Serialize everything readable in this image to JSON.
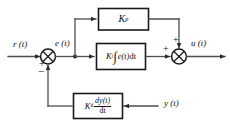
{
  "diagram": {
    "type": "control-system-block-diagram",
    "background_color": "#ffffff",
    "line_color": "#4d4d4d",
    "block_border_color": "#1a1a1a",
    "signals": {
      "reference": "r (t)",
      "error": "e (t)",
      "control_output": "u (t)",
      "feedback_measurement": "y (t)"
    },
    "blocks": [
      {
        "id": "proportional",
        "gain_symbol": "K",
        "gain_subscript": "p",
        "expression": "K_p",
        "role": "proportional-gain"
      },
      {
        "id": "integral",
        "gain_symbol": "K",
        "gain_subscript": "i",
        "integrand": "e(t)",
        "differential": "dt",
        "expression": "K_i ∫ e(t)dt",
        "role": "integral-term"
      },
      {
        "id": "derivative",
        "gain_symbol": "K",
        "gain_subscript": "d",
        "numerator": "dy(t)",
        "denominator": "dt",
        "expression": "K_d dy(t)/dt",
        "role": "derivative-term"
      }
    ],
    "summing_junctions": [
      {
        "id": "error-junction",
        "inputs": [
          {
            "from": "reference",
            "sign": "+",
            "side": "left"
          },
          {
            "from": "derivative-feedback",
            "sign": "−",
            "side": "bottom"
          }
        ],
        "output": "e (t)"
      },
      {
        "id": "output-junction",
        "inputs": [
          {
            "from": "integral",
            "sign": "+",
            "side": "left"
          },
          {
            "from": "proportional",
            "sign": "+",
            "side": "top"
          }
        ],
        "output": "u (t)"
      }
    ]
  }
}
